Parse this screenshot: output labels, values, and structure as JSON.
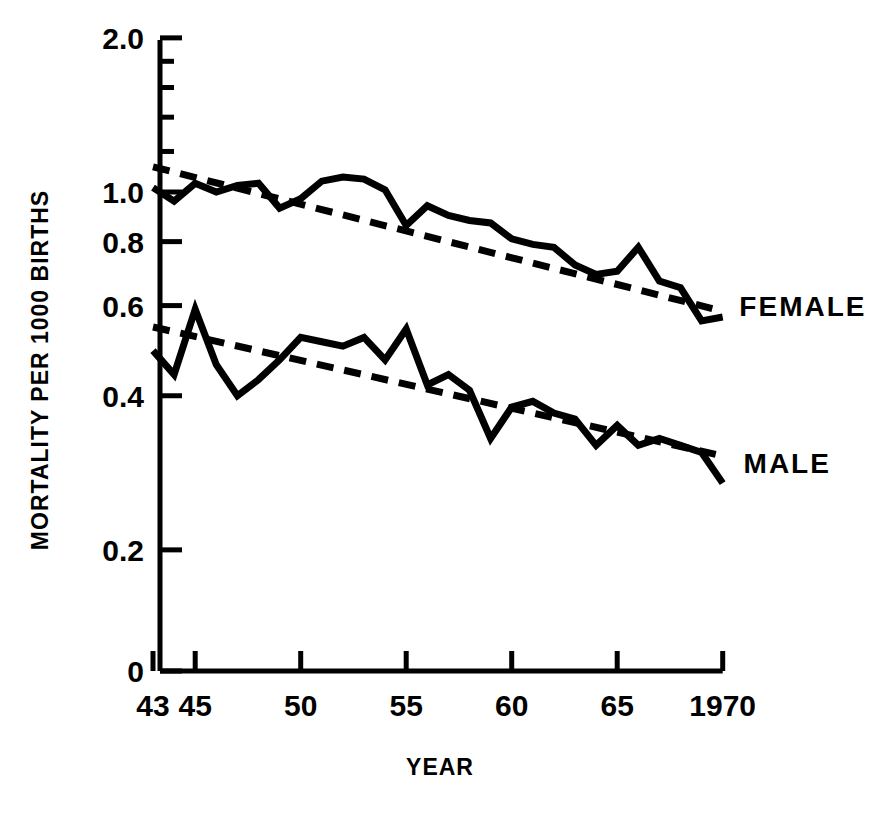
{
  "figure": {
    "background": "#ffffff",
    "ink": "#000000"
  },
  "chart_data": {
    "type": "line",
    "title": "",
    "subtitle": "",
    "xlabel": "YEAR",
    "ylabel": "MORTALITY PER 1000 BIRTHS",
    "yscale": "log",
    "ylim": [
      0.18,
      2.0
    ],
    "xlim": [
      43,
      70
    ],
    "grid": false,
    "legend_position": "inline-right",
    "y_tick_labels": [
      "2.0",
      "1.0",
      "0.8",
      "0.6",
      "0.4",
      "0.2",
      "0"
    ],
    "y_tick_values": [
      2.0,
      1.0,
      0.8,
      0.6,
      0.4,
      0.2,
      0
    ],
    "y_minor_ticks": [
      1.8,
      1.6,
      1.4,
      1.2
    ],
    "x_tick_labels": [
      "43",
      "45",
      "50",
      "55",
      "60",
      "65",
      "1970"
    ],
    "x_tick_values": [
      43,
      45,
      50,
      55,
      60,
      65,
      70
    ],
    "x": [
      43,
      44,
      45,
      46,
      47,
      48,
      49,
      50,
      51,
      52,
      53,
      54,
      55,
      56,
      57,
      58,
      59,
      60,
      61,
      62,
      63,
      64,
      65,
      66,
      67,
      68,
      69,
      70
    ],
    "series": [
      {
        "name": "FEMALE",
        "label": "FEMALE",
        "style": "solid",
        "values": [
          1.02,
          0.96,
          1.04,
          1.0,
          1.03,
          1.04,
          0.93,
          0.97,
          1.05,
          1.07,
          1.06,
          1.01,
          0.86,
          0.94,
          0.9,
          0.88,
          0.87,
          0.81,
          0.79,
          0.78,
          0.72,
          0.69,
          0.7,
          0.78,
          0.67,
          0.65,
          0.56,
          0.57
        ]
      },
      {
        "name": "MALE",
        "label": "MALE",
        "style": "solid",
        "values": [
          0.49,
          0.44,
          0.59,
          0.46,
          0.4,
          0.43,
          0.47,
          0.52,
          0.51,
          0.5,
          0.52,
          0.47,
          0.54,
          0.42,
          0.44,
          0.41,
          0.33,
          0.38,
          0.39,
          0.37,
          0.36,
          0.32,
          0.35,
          0.32,
          0.33,
          0.32,
          0.31,
          0.27
        ]
      },
      {
        "name": "FEMALE trend",
        "label": "",
        "style": "dashed",
        "endpoints": [
          [
            43,
            1.12
          ],
          [
            70,
            0.585
          ]
        ]
      },
      {
        "name": "MALE trend",
        "label": "",
        "style": "dashed",
        "endpoints": [
          [
            43,
            0.545
          ],
          [
            70,
            0.305
          ]
        ]
      }
    ],
    "annotations": [
      {
        "text": "FEMALE",
        "x": 70.6,
        "y": 0.6
      },
      {
        "text": "MALE",
        "x": 70.8,
        "y": 0.295
      }
    ]
  }
}
